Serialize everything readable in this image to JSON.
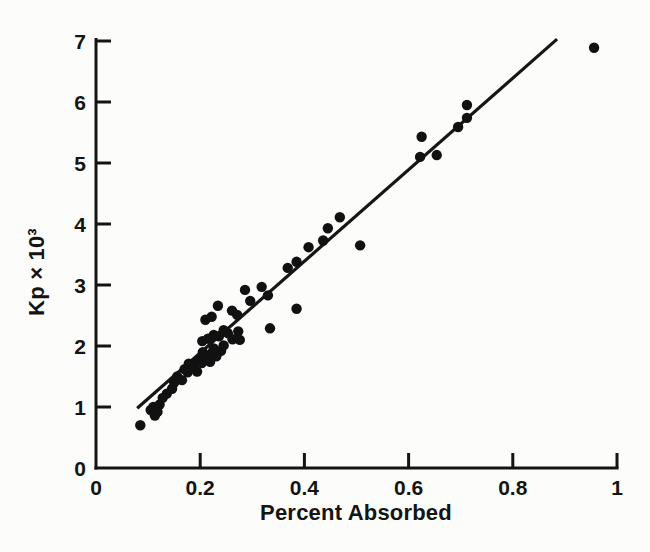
{
  "figure": {
    "background_color": "#fcfcfa",
    "ink_color": "#141414"
  },
  "chart_data": {
    "type": "scatter",
    "title": "",
    "xlabel": "Percent Absorbed",
    "ylabel": "Kp × 10³",
    "xlim": [
      0,
      1
    ],
    "ylim": [
      0,
      7
    ],
    "grid": false,
    "legend": "none",
    "x_ticks": [
      {
        "value": 0,
        "label": "0"
      },
      {
        "value": 0.2,
        "label": "0.2"
      },
      {
        "value": 0.4,
        "label": "0.4"
      },
      {
        "value": 0.6,
        "label": "0.6"
      },
      {
        "value": 0.8,
        "label": "0.8"
      },
      {
        "value": 1,
        "label": "1"
      }
    ],
    "y_ticks": [
      {
        "value": 0,
        "label": "0"
      },
      {
        "value": 1,
        "label": "1"
      },
      {
        "value": 2,
        "label": "2"
      },
      {
        "value": 3,
        "label": "3"
      },
      {
        "value": 4,
        "label": "4"
      },
      {
        "value": 5,
        "label": "5"
      },
      {
        "value": 6,
        "label": "6"
      },
      {
        "value": 7,
        "label": "7"
      }
    ],
    "marker": {
      "shape": "circle",
      "radius_px": 5.2,
      "color": "#111111"
    },
    "fit_line": {
      "x1": 0.079,
      "y1": 0.98,
      "x2": 0.885,
      "y2": 7.03,
      "color": "#161616",
      "width_px": 3.2
    },
    "points": [
      [
        0.085,
        0.7
      ],
      [
        0.105,
        0.95
      ],
      [
        0.11,
        1.0
      ],
      [
        0.113,
        0.86
      ],
      [
        0.118,
        0.92
      ],
      [
        0.122,
        1.04
      ],
      [
        0.128,
        1.15
      ],
      [
        0.136,
        1.22
      ],
      [
        0.146,
        1.3
      ],
      [
        0.15,
        1.4
      ],
      [
        0.156,
        1.5
      ],
      [
        0.165,
        1.44
      ],
      [
        0.17,
        1.62
      ],
      [
        0.176,
        1.57
      ],
      [
        0.178,
        1.71
      ],
      [
        0.186,
        1.66
      ],
      [
        0.194,
        1.58
      ],
      [
        0.196,
        1.76
      ],
      [
        0.203,
        1.72
      ],
      [
        0.205,
        1.9
      ],
      [
        0.211,
        1.81
      ],
      [
        0.219,
        1.74
      ],
      [
        0.222,
        1.88
      ],
      [
        0.226,
        1.96
      ],
      [
        0.231,
        1.83
      ],
      [
        0.24,
        1.92
      ],
      [
        0.245,
        2.01
      ],
      [
        0.204,
        2.08
      ],
      [
        0.215,
        2.12
      ],
      [
        0.226,
        2.18
      ],
      [
        0.236,
        2.16
      ],
      [
        0.245,
        2.26
      ],
      [
        0.253,
        2.21
      ],
      [
        0.262,
        2.11
      ],
      [
        0.276,
        2.1
      ],
      [
        0.21,
        2.43
      ],
      [
        0.222,
        2.48
      ],
      [
        0.234,
        2.66
      ],
      [
        0.261,
        2.58
      ],
      [
        0.271,
        2.51
      ],
      [
        0.273,
        2.24
      ],
      [
        0.286,
        2.92
      ],
      [
        0.296,
        2.74
      ],
      [
        0.318,
        2.97
      ],
      [
        0.33,
        2.83
      ],
      [
        0.334,
        2.29
      ],
      [
        0.368,
        3.28
      ],
      [
        0.385,
        3.38
      ],
      [
        0.385,
        2.61
      ],
      [
        0.408,
        3.62
      ],
      [
        0.436,
        3.73
      ],
      [
        0.445,
        3.93
      ],
      [
        0.468,
        4.11
      ],
      [
        0.507,
        3.65
      ],
      [
        0.622,
        5.1
      ],
      [
        0.625,
        5.43
      ],
      [
        0.654,
        5.13
      ],
      [
        0.695,
        5.59
      ],
      [
        0.712,
        5.74
      ],
      [
        0.712,
        5.95
      ],
      [
        0.956,
        6.89
      ]
    ]
  }
}
